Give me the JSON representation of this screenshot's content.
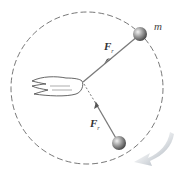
{
  "diagram": {
    "labels": {
      "mass": "m",
      "force_top": "F",
      "force_top_sub": "r",
      "force_bottom": "F",
      "force_bottom_sub": "r"
    },
    "colors": {
      "path": "#555555",
      "string": "#7a7a7a",
      "ball": "#8a8a8a",
      "motion_arrow": "#9aa3ad"
    }
  }
}
